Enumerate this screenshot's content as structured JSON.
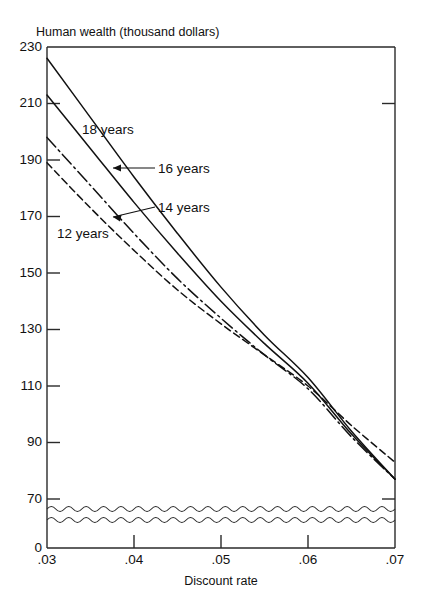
{
  "chart_data": {
    "type": "line",
    "title": "Human wealth (thousand dollars)",
    "xlabel": "Discount rate",
    "ylabel": "Human wealth (thousand dollars)",
    "x": [
      0.03,
      0.035,
      0.04,
      0.045,
      0.05,
      0.055,
      0.06,
      0.065,
      0.07
    ],
    "xtick_labels": [
      ".03",
      ".04",
      ".05",
      ".06",
      ".07"
    ],
    "xtick_values": [
      0.03,
      0.04,
      0.05,
      0.06,
      0.07
    ],
    "ytick_labels": [
      "230",
      "210",
      "190",
      "170",
      "150",
      "130",
      "110",
      "90",
      "70",
      "0"
    ],
    "ytick_values": [
      230,
      210,
      190,
      170,
      150,
      130,
      110,
      90,
      70,
      0
    ],
    "xlim": [
      0.03,
      0.07
    ],
    "ylim": [
      70,
      230
    ],
    "y_axis_break": true,
    "y_axis_break_between": [
      0,
      70
    ],
    "grid": false,
    "legend_position": "inline-annotations",
    "series": [
      {
        "name": "18 years",
        "label": "18 years",
        "style": "solid",
        "values": [
          226,
          205,
          184,
          164,
          145,
          128,
          113,
          94,
          77
        ]
      },
      {
        "name": "16 years",
        "label": "16 years",
        "style": "solid",
        "values": [
          213,
          194,
          175,
          157,
          140,
          125,
          111,
          93,
          77
        ]
      },
      {
        "name": "14 years",
        "label": "14 years",
        "style": "dash-dot",
        "values": [
          198,
          181,
          164,
          148,
          134,
          121,
          109,
          92,
          77
        ]
      },
      {
        "name": "12 years",
        "label": "12 years",
        "style": "dashed",
        "values": [
          189,
          173,
          158,
          144,
          132,
          121,
          110,
          96,
          83
        ]
      }
    ],
    "annotations": [
      {
        "text": "18 years",
        "kind": "inline-label",
        "leader": false
      },
      {
        "text": "16 years",
        "kind": "inline-label",
        "leader": true
      },
      {
        "text": "14 years",
        "kind": "inline-label",
        "leader": true
      },
      {
        "text": "12 years",
        "kind": "inline-label",
        "leader": false
      }
    ]
  }
}
